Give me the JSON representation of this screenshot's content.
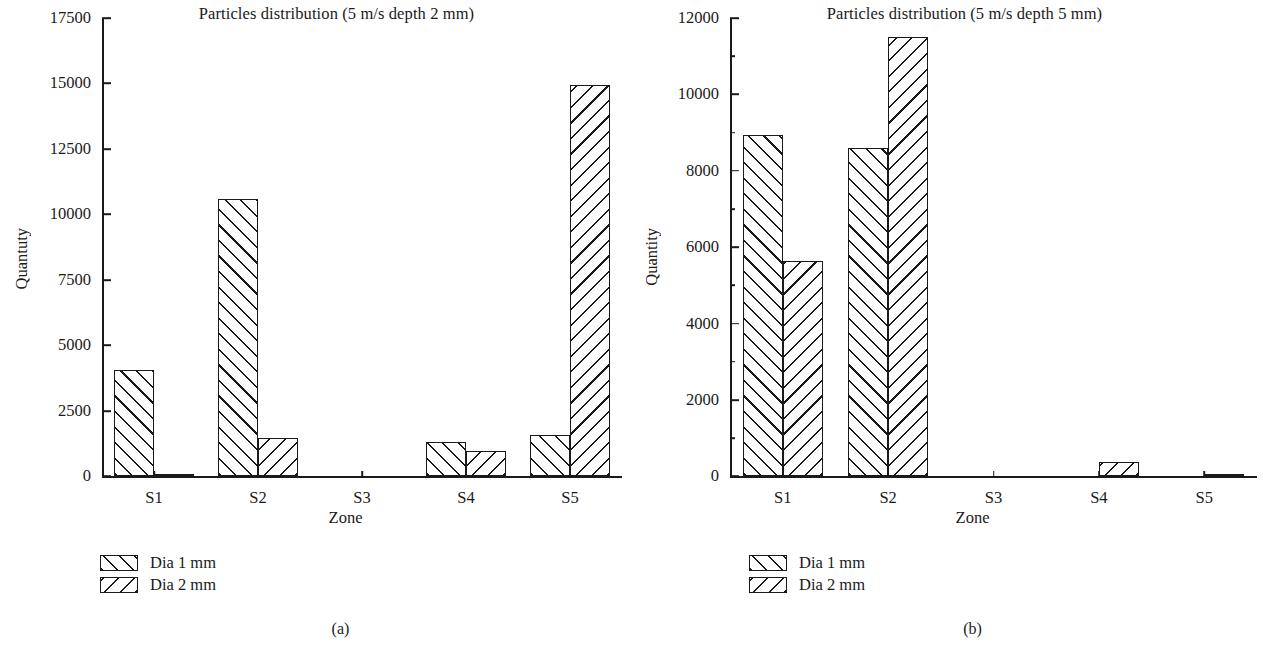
{
  "figure": {
    "panels": [
      {
        "id": "a",
        "subcaption": "(a)",
        "title": "Particles distribution (5 m/s depth 2 mm)",
        "xlabel": "Zone",
        "ylabel": "Quantuty",
        "legend": [
          {
            "label": "Dia 1 mm",
            "hatch": "hatch-fwd"
          },
          {
            "label": "Dia 2 mm",
            "hatch": "hatch-back"
          }
        ],
        "yticks": [
          "0",
          "2500",
          "5000",
          "7500",
          "10000",
          "12500",
          "15000",
          "17500"
        ],
        "xticks": [
          "S1",
          "S2",
          "S3",
          "S4",
          "S5"
        ]
      },
      {
        "id": "b",
        "subcaption": "(b)",
        "title": "Particles distribution (5 m/s depth 5 mm)",
        "xlabel": "Zone",
        "ylabel": "Quantity",
        "legend": [
          {
            "label": "Dia 1 mm",
            "hatch": "hatch-fwd"
          },
          {
            "label": "Dia 2 mm",
            "hatch": "hatch-back"
          }
        ],
        "yticks": [
          "0",
          "2000",
          "4000",
          "6000",
          "8000",
          "10000",
          "12000"
        ],
        "xticks": [
          "S1",
          "S2",
          "S3",
          "S4",
          "S5"
        ]
      }
    ]
  },
  "chart_data": [
    {
      "type": "bar",
      "title": "Particles distribution (5 m/s depth 2 mm)",
      "subcaption": "(a)",
      "xlabel": "Zone",
      "ylabel": "Quantuty",
      "categories": [
        "S1",
        "S2",
        "S3",
        "S4",
        "S5"
      ],
      "series": [
        {
          "name": "Dia 1 mm",
          "values": [
            4050,
            10600,
            0,
            1330,
            1600
          ]
        },
        {
          "name": "Dia 2 mm",
          "values": [
            110,
            1480,
            0,
            960,
            14950
          ]
        }
      ],
      "ylim": [
        0,
        17500
      ],
      "ytick_values": [
        0,
        2500,
        5000,
        7500,
        10000,
        12500,
        15000,
        17500
      ],
      "grid": false,
      "legend_position": "below-left"
    },
    {
      "type": "bar",
      "title": "Particles distribution (5 m/s depth 5 mm)",
      "subcaption": "(b)",
      "xlabel": "Zone",
      "ylabel": "Quantity",
      "categories": [
        "S1",
        "S2",
        "S3",
        "S4",
        "S5"
      ],
      "series": [
        {
          "name": "Dia 1 mm",
          "values": [
            8930,
            8600,
            0,
            0,
            0
          ]
        },
        {
          "name": "Dia 2 mm",
          "values": [
            5650,
            11500,
            0,
            380,
            30
          ]
        }
      ],
      "ylim": [
        0,
        12000
      ],
      "ytick_values": [
        0,
        2000,
        4000,
        6000,
        8000,
        10000,
        12000
      ],
      "grid": false,
      "legend_position": "below-left"
    }
  ]
}
